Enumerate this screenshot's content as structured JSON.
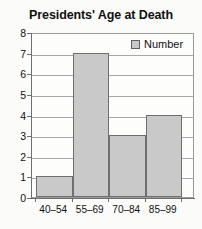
{
  "chart_data": {
    "type": "bar",
    "title": "Presidents' Age at Death",
    "categories": [
      "40–54",
      "55–69",
      "70–84",
      "85–99"
    ],
    "values": [
      1,
      7,
      3,
      4
    ],
    "series": [
      {
        "name": "Number",
        "values": [
          1,
          7,
          3,
          4
        ]
      }
    ],
    "xlabel": "",
    "ylabel": "",
    "ylim": [
      0,
      8
    ],
    "ytick_labels": [
      "0",
      "1",
      "2",
      "3",
      "4",
      "5",
      "6",
      "7",
      "8"
    ],
    "ytick_values": [
      0,
      1,
      2,
      3,
      4,
      5,
      6,
      7,
      8
    ],
    "grid": true,
    "legend": {
      "position": "top-right",
      "entries": [
        {
          "label": "Number",
          "color": "#c9c9c9"
        }
      ]
    },
    "colors": {
      "bar_fill": "#c9c9c9",
      "bar_border": "#6f6f6f",
      "gridline": "#a8a8a8",
      "axis": "#6e6e6e",
      "text": "#111111",
      "background": "#fbfbfa"
    }
  }
}
